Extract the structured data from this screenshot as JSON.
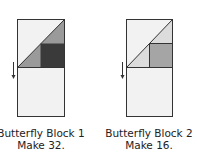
{
  "blocks": [
    {
      "caption_line1": "Butterfly Block 1",
      "caption_line2": "Make 32.",
      "colors": {
        "background": "#f2f2f2",
        "triangle": "#9a9a9a",
        "square": "#3a3a3a",
        "outline": "#333333"
      }
    },
    {
      "caption_line1": "Butterfly Block 2",
      "caption_line2": "Make 16.",
      "colors": {
        "background": "#f2f2f2",
        "triangle": "#dcdcdc",
        "square": "#a5a5a5",
        "outline": "#333333"
      }
    }
  ]
}
